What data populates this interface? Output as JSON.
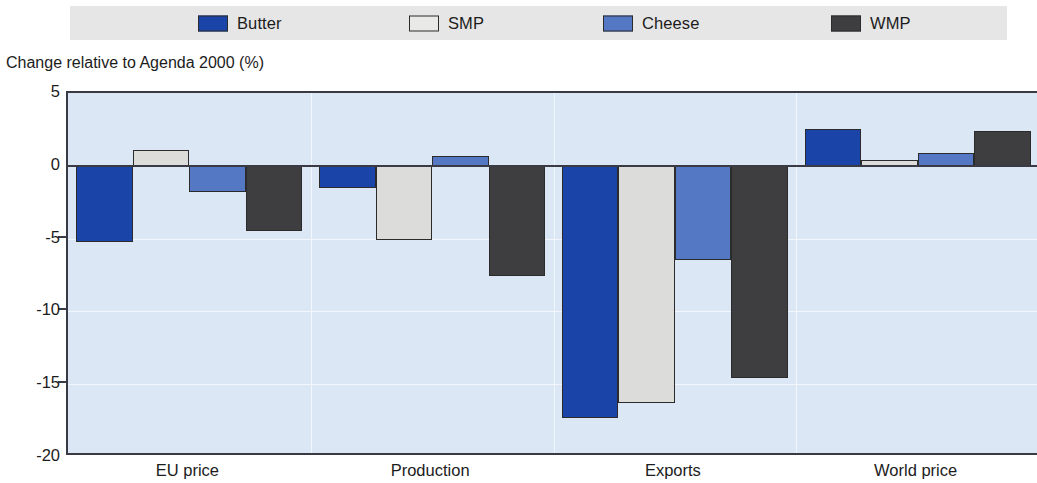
{
  "axis_title": "Change relative to Agenda 2000 (%)",
  "legend": {
    "items": [
      {
        "label": "Butter",
        "color": "#1a44a8",
        "x": 198
      },
      {
        "label": "SMP",
        "color": "#e9e9e7",
        "x": 409
      },
      {
        "label": "Cheese",
        "color": "#5578c4",
        "x": 603
      },
      {
        "label": "WMP",
        "color": "#3e3e40",
        "x": 831
      }
    ]
  },
  "colors": {
    "butter": "#1a44a8",
    "smp": "#dcdcda",
    "cheese": "#5578c4",
    "wmp": "#3e3e40",
    "plot_background": "#dbe7f5",
    "legend_background": "#e6e6e6",
    "axis": "#3a3a44",
    "gridline": "#f2f7fd"
  },
  "chart_data": {
    "type": "bar",
    "title": "",
    "subtitle": "",
    "xlabel": "",
    "ylabel": "Change relative to Agenda 2000 (%)",
    "ylim": [
      -20,
      5
    ],
    "yticks": [
      5,
      0,
      -5,
      -10,
      -15,
      -20
    ],
    "ytick_labels": [
      "5",
      "0",
      "-5",
      "-10",
      "-15",
      "-20"
    ],
    "grid": true,
    "legend_position": "top",
    "categories": [
      "EU price",
      "Production",
      "Exports",
      "World price"
    ],
    "series": [
      {
        "name": "Butter",
        "color": "#1a44a8",
        "values": [
          -5.2,
          -1.5,
          -17.3,
          2.5
        ]
      },
      {
        "name": "SMP",
        "color": "#dcdcda",
        "values": [
          1.1,
          -5.1,
          -16.3,
          0.4
        ]
      },
      {
        "name": "Cheese",
        "color": "#5578c4",
        "values": [
          -1.8,
          0.7,
          -6.5,
          0.9
        ]
      },
      {
        "name": "WMP",
        "color": "#3e3e40",
        "values": [
          -4.5,
          -7.6,
          -14.6,
          2.4
        ]
      }
    ]
  }
}
